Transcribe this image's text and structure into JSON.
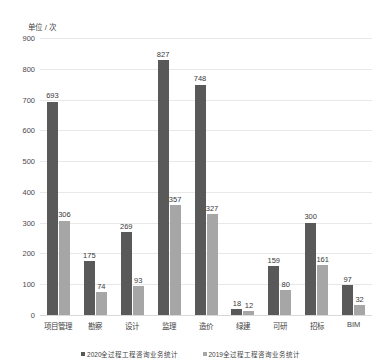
{
  "chart_data": {
    "type": "bar",
    "title": "",
    "subtitle": "",
    "xlabel": "",
    "ylabel": "单位 / 次",
    "ylim": [
      0,
      900
    ],
    "ytick_step": 100,
    "yticks": [
      "900",
      "800",
      "700",
      "600",
      "500",
      "400",
      "300",
      "200",
      "100",
      "0"
    ],
    "grid": true,
    "legend_position": "bottom",
    "categories": [
      "项目管理",
      "勘察",
      "设计",
      "监理",
      "造价",
      "绿建",
      "可研",
      "招标",
      "BIM"
    ],
    "series": [
      {
        "name": "2020全过程工程咨询业务统计",
        "color": "#595959",
        "values": [
          693,
          175,
          269,
          827,
          748,
          18,
          159,
          300,
          97
        ]
      },
      {
        "name": "2019全过程工程咨询业务统计",
        "color": "#a6a6a6",
        "values": [
          306,
          74,
          93,
          357,
          327,
          12,
          80,
          161,
          32
        ]
      }
    ]
  },
  "legend": {
    "items": [
      {
        "label": "2020全过程工程咨询业务统计",
        "marker": "square-swatch-dark"
      },
      {
        "label": "2019全过程工程咨询业务统计",
        "marker": "square-swatch-light"
      }
    ]
  },
  "colors": {
    "series_2020": "#595959",
    "series_2019": "#a6a6a6",
    "gridline": "#e8e8e8",
    "text": "#3f3f3f",
    "background": "#ffffff"
  }
}
